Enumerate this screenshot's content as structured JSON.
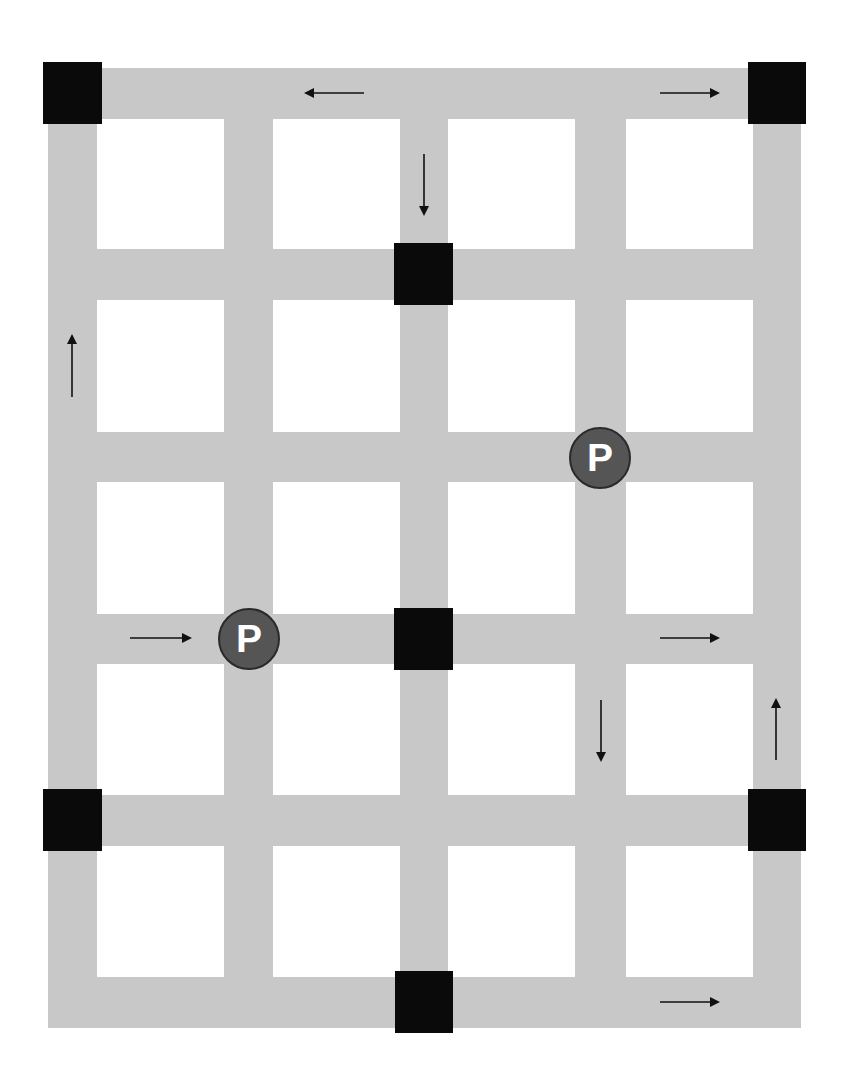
{
  "map": {
    "width": 850,
    "height": 1082,
    "colors": {
      "road": "#c8c8c8",
      "block": "#ffffff",
      "node": "#0a0a0a",
      "parking_fill": "#555555",
      "parking_text": "#ffffff",
      "arrow": "#111111"
    },
    "roads": {
      "vertical": [
        {
          "x": 48,
          "w": 49
        },
        {
          "x": 224,
          "w": 49
        },
        {
          "x": 400,
          "w": 48
        },
        {
          "x": 575,
          "w": 51
        },
        {
          "x": 753,
          "w": 48
        }
      ],
      "horizontal": [
        {
          "y": 68,
          "h": 51
        },
        {
          "y": 249,
          "h": 51
        },
        {
          "y": 432,
          "h": 50
        },
        {
          "y": 614,
          "h": 50
        },
        {
          "y": 795,
          "h": 51
        },
        {
          "y": 977,
          "h": 51
        }
      ],
      "extent": {
        "x0": 48,
        "y0": 68,
        "x1": 801,
        "y1": 1028
      }
    },
    "nodes": [
      {
        "id": "top-left",
        "x": 43,
        "y": 62,
        "w": 59,
        "h": 62
      },
      {
        "id": "top-right",
        "x": 748,
        "y": 62,
        "w": 58,
        "h": 62
      },
      {
        "id": "center-upper",
        "x": 394,
        "y": 243,
        "w": 59,
        "h": 62
      },
      {
        "id": "center-middle",
        "x": 394,
        "y": 608,
        "w": 59,
        "h": 62
      },
      {
        "id": "left-lower",
        "x": 43,
        "y": 789,
        "w": 59,
        "h": 62
      },
      {
        "id": "right-lower",
        "x": 748,
        "y": 789,
        "w": 58,
        "h": 62
      },
      {
        "id": "bottom-center",
        "x": 395,
        "y": 971,
        "w": 58,
        "h": 62
      }
    ],
    "parking": [
      {
        "id": "parking-upper-right",
        "label": "P",
        "cx": 600,
        "cy": 458,
        "r": 31
      },
      {
        "id": "parking-lower-left",
        "label": "P",
        "cx": 249,
        "cy": 639,
        "r": 31
      }
    ],
    "arrows": [
      {
        "id": "arrow-top-left",
        "direction": "left",
        "x1": 364,
        "y1": 93,
        "x2": 306,
        "y2": 93
      },
      {
        "id": "arrow-top-right",
        "direction": "right",
        "x1": 660,
        "y1": 93,
        "x2": 718,
        "y2": 93
      },
      {
        "id": "arrow-center-down",
        "direction": "down",
        "x1": 424,
        "y1": 154,
        "x2": 424,
        "y2": 214
      },
      {
        "id": "arrow-left-up",
        "direction": "up",
        "x1": 72,
        "y1": 397,
        "x2": 72,
        "y2": 336
      },
      {
        "id": "arrow-middle-left",
        "direction": "right",
        "x1": 130,
        "y1": 638,
        "x2": 190,
        "y2": 638
      },
      {
        "id": "arrow-middle-right",
        "direction": "right",
        "x1": 660,
        "y1": 638,
        "x2": 718,
        "y2": 638
      },
      {
        "id": "arrow-lower-down",
        "direction": "down",
        "x1": 601,
        "y1": 700,
        "x2": 601,
        "y2": 760
      },
      {
        "id": "arrow-lower-up",
        "direction": "up",
        "x1": 776,
        "y1": 760,
        "x2": 776,
        "y2": 700
      },
      {
        "id": "arrow-bottom-right",
        "direction": "right",
        "x1": 660,
        "y1": 1002,
        "x2": 718,
        "y2": 1002
      }
    ]
  }
}
